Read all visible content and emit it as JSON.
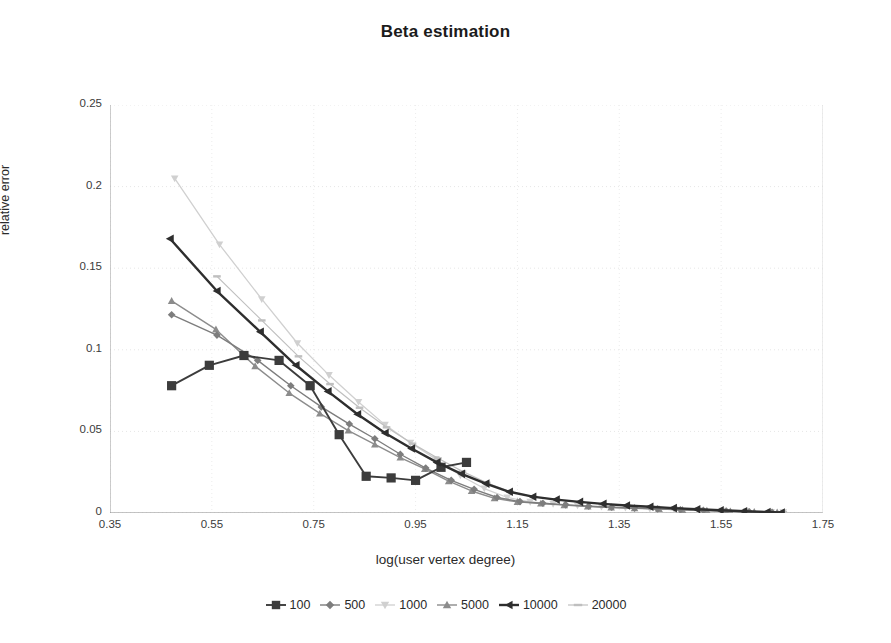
{
  "chart_data": {
    "type": "line",
    "title": "Beta estimation",
    "xlabel": "log(user vertex degree)",
    "ylabel": "relative error",
    "xlim": [
      0.35,
      1.75
    ],
    "ylim": [
      0,
      0.25
    ],
    "xticks": [
      "0.35",
      "0.55",
      "0.75",
      "0.95",
      "1.15",
      "1.35",
      "1.55",
      "1.75"
    ],
    "xtick_values": [
      0.35,
      0.55,
      0.75,
      0.95,
      1.15,
      1.35,
      1.55,
      1.75
    ],
    "yticks": [
      "0",
      "0.05",
      "0.1",
      "0.15",
      "0.2",
      "0.25"
    ],
    "ytick_values": [
      0,
      0.05,
      0.1,
      0.15,
      0.2,
      0.25
    ],
    "grid": true,
    "legend_position": "bottom",
    "series": [
      {
        "name": "100",
        "marker": "square",
        "color": "#3c3c3c",
        "linewidth": 1.9,
        "x": [
          0.471,
          0.545,
          0.613,
          0.682,
          0.743,
          0.8,
          0.853,
          0.902,
          0.95,
          1.0,
          1.05
        ],
        "y": [
          0.078,
          0.0905,
          0.0965,
          0.0935,
          0.078,
          0.048,
          0.0225,
          0.0215,
          0.02,
          0.028,
          0.031
        ]
      },
      {
        "name": "500",
        "marker": "diamond",
        "color": "#7d7d7d",
        "linewidth": 1.4,
        "x": [
          0.471,
          0.56,
          0.64,
          0.705,
          0.765,
          0.82,
          0.87,
          0.92,
          0.97,
          1.02,
          1.065,
          1.11,
          1.155,
          1.2,
          1.245,
          1.29,
          1.335,
          1.38,
          1.425,
          1.47,
          1.515,
          1.56,
          1.605,
          1.65
        ],
        "y": [
          0.1215,
          0.109,
          0.0935,
          0.078,
          0.065,
          0.0545,
          0.0455,
          0.036,
          0.0275,
          0.02,
          0.0145,
          0.0095,
          0.007,
          0.006,
          0.005,
          0.0042,
          0.0035,
          0.003,
          0.0025,
          0.002,
          0.0016,
          0.0012,
          0.0008,
          0.0005
        ]
      },
      {
        "name": "1000",
        "marker": "triangle-down",
        "color": "#d0d0d0",
        "linewidth": 1.3,
        "x": [
          0.477,
          0.565,
          0.648,
          0.718,
          0.78,
          0.838,
          0.89,
          0.94,
          0.99,
          1.038,
          1.085,
          1.13,
          1.175,
          1.22,
          1.268,
          1.315,
          1.362,
          1.41,
          1.458,
          1.505,
          1.552,
          1.6,
          1.648,
          1.672
        ],
        "y": [
          0.205,
          0.1645,
          0.131,
          0.104,
          0.0845,
          0.068,
          0.054,
          0.043,
          0.033,
          0.023,
          0.015,
          0.0095,
          0.0068,
          0.0056,
          0.0046,
          0.0038,
          0.0032,
          0.0027,
          0.0022,
          0.0018,
          0.0014,
          0.001,
          0.0006,
          0.0004
        ]
      },
      {
        "name": "5000",
        "marker": "triangle-up",
        "color": "#8c8c8c",
        "linewidth": 1.4,
        "x": [
          0.471,
          0.558,
          0.635,
          0.702,
          0.762,
          0.818,
          0.87,
          0.92,
          0.968,
          1.015,
          1.06,
          1.105,
          1.15,
          1.196,
          1.242,
          1.288,
          1.334,
          1.38,
          1.428,
          1.474,
          1.522,
          1.568,
          1.615,
          1.66
        ],
        "y": [
          0.13,
          0.1125,
          0.09,
          0.0735,
          0.061,
          0.0505,
          0.042,
          0.034,
          0.027,
          0.0195,
          0.0135,
          0.009,
          0.0068,
          0.0058,
          0.0048,
          0.004,
          0.0034,
          0.0029,
          0.0024,
          0.0019,
          0.0015,
          0.0011,
          0.0007,
          0.0004
        ]
      },
      {
        "name": "10000",
        "marker": "triangle-left",
        "color": "#2e2e2e",
        "linewidth": 2.4,
        "x": [
          0.468,
          0.56,
          0.645,
          0.715,
          0.778,
          0.836,
          0.89,
          0.942,
          0.992,
          1.04,
          1.088,
          1.134,
          1.18,
          1.226,
          1.272,
          1.318,
          1.364,
          1.41,
          1.456,
          1.502,
          1.548,
          1.594,
          1.64,
          1.668
        ],
        "y": [
          0.168,
          0.136,
          0.111,
          0.0905,
          0.0745,
          0.0605,
          0.049,
          0.0395,
          0.031,
          0.024,
          0.018,
          0.013,
          0.01,
          0.0082,
          0.0068,
          0.0056,
          0.0046,
          0.0038,
          0.003,
          0.0023,
          0.0017,
          0.0011,
          0.0006,
          0.0003
        ]
      },
      {
        "name": "20000",
        "marker": "dash",
        "color": "#bfbfbf",
        "linewidth": 1.2,
        "x": [
          0.56,
          0.648,
          0.72,
          0.782,
          0.84,
          0.893,
          0.944,
          0.994,
          1.042,
          1.09,
          1.136,
          1.182,
          1.228,
          1.274,
          1.32,
          1.366,
          1.412,
          1.46,
          1.506,
          1.553,
          1.6,
          1.646,
          1.672
        ],
        "y": [
          0.145,
          0.118,
          0.096,
          0.079,
          0.0645,
          0.0525,
          0.0425,
          0.0335,
          0.0255,
          0.0185,
          0.013,
          0.0098,
          0.008,
          0.0066,
          0.0054,
          0.0045,
          0.0037,
          0.003,
          0.0024,
          0.0019,
          0.0014,
          0.0009,
          0.0005
        ]
      }
    ]
  }
}
